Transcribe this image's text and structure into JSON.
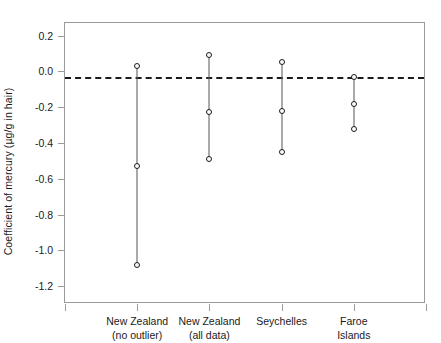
{
  "chart_data": {
    "type": "scatter",
    "title": "",
    "xlabel": "",
    "ylabel": "Coefficient of mercury (µg/g in hair)",
    "ylim": [
      -1.3,
      0.27
    ],
    "yticks": [
      0.2,
      0.0,
      -0.2,
      -0.4,
      -0.6,
      -0.8,
      -1.0,
      -1.2
    ],
    "ytick_labels": [
      "0.2",
      "0.0",
      "-0.2",
      "-0.4",
      "-0.6",
      "-0.8",
      "-1.0",
      "-1.2"
    ],
    "grid": false,
    "legend": "none",
    "reference_line": {
      "value": -0.03,
      "style": "dashed",
      "color": "#1a1a1a"
    },
    "categories": [
      "New Zealand\n(no outlier)",
      "New Zealand\n(all data)",
      "Seychelles",
      "Faroe\nIslands"
    ],
    "category_labels": [
      {
        "line1": "New Zealand",
        "line2": "(no outlier)"
      },
      {
        "line1": "New Zealand",
        "line2": "(all data)"
      },
      {
        "line1": "Seychelles",
        "line2": ""
      },
      {
        "line1": "Faroe",
        "line2": "Islands"
      }
    ],
    "series": [
      {
        "name": "New Zealand (no outlier)",
        "upper": 0.03,
        "estimate": -0.53,
        "lower": -1.08
      },
      {
        "name": "New Zealand (all data)",
        "upper": 0.09,
        "estimate": -0.23,
        "lower": -0.49
      },
      {
        "name": "Seychelles",
        "upper": 0.05,
        "estimate": -0.22,
        "lower": -0.45
      },
      {
        "name": "Faroe Islands",
        "upper": -0.03,
        "estimate": -0.18,
        "lower": -0.32
      }
    ],
    "marker_color": "#1a1a1a",
    "stem_color": "#555555",
    "frame_color": "#9a9a9a"
  }
}
